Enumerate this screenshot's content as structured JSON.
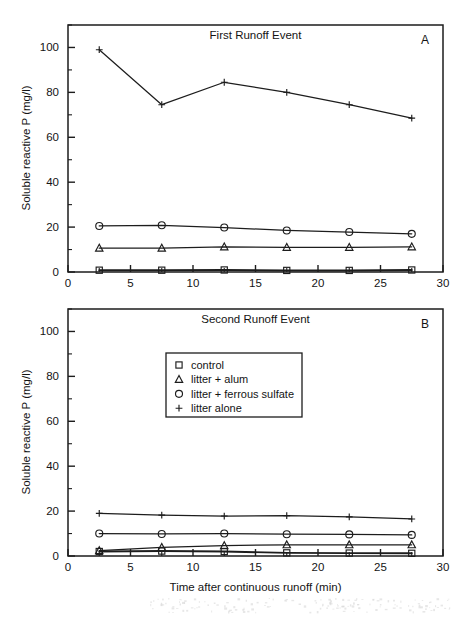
{
  "figure": {
    "axis_titles": {
      "y": "Soluble reactive P (mg/l)",
      "x": "Time after continuous runoff (min)"
    },
    "legend": {
      "entries": [
        {
          "marker": "square",
          "label": "control"
        },
        {
          "marker": "triangle",
          "label": "litter + alum"
        },
        {
          "marker": "circle",
          "label": "litter + ferrous sulfate"
        },
        {
          "marker": "plus",
          "label": "litter alone"
        }
      ]
    }
  },
  "chart_data": [
    {
      "type": "line",
      "panel": "A",
      "panel_letter": "A",
      "title": "First Runoff Event",
      "xlabel": "Time after continuous runoff (min)",
      "ylabel": "Soluble reactive P (mg/l)",
      "xlim": [
        0,
        30
      ],
      "ylim": [
        0,
        110
      ],
      "xticks": [
        0,
        5,
        10,
        15,
        20,
        25,
        30
      ],
      "xticklabels": [
        "0",
        "5",
        "10",
        "15",
        "20",
        "25",
        "30"
      ],
      "yticks": [
        0,
        20,
        40,
        60,
        80,
        100
      ],
      "yticklabels": [
        "0",
        "20",
        "40",
        "60",
        "80",
        "100"
      ],
      "yminorticks": [
        10,
        30,
        50,
        70,
        90,
        110
      ],
      "xminorticks": [
        2.5,
        7.5,
        12.5,
        17.5,
        22.5,
        27.5
      ],
      "grid": false,
      "legend": "none",
      "x": [
        2.5,
        7.5,
        12.5,
        17.5,
        22.5,
        27.5
      ],
      "series": [
        {
          "name": "litter alone",
          "marker": "plus",
          "values": [
            99.0,
            74.5,
            84.5,
            80.0,
            74.5,
            68.5
          ]
        },
        {
          "name": "litter + ferrous sulfate",
          "marker": "circle",
          "values": [
            20.5,
            20.8,
            19.8,
            18.5,
            17.8,
            17.0
          ]
        },
        {
          "name": "litter + alum",
          "marker": "triangle",
          "values": [
            10.6,
            10.6,
            11.2,
            11.0,
            11.0,
            11.2
          ]
        },
        {
          "name": "control",
          "marker": "square",
          "values": [
            0.8,
            0.8,
            0.9,
            0.7,
            0.7,
            0.9
          ]
        }
      ]
    },
    {
      "type": "line",
      "panel": "B",
      "panel_letter": "B",
      "title": "Second Runoff Event",
      "xlabel": "Time after continuous runoff (min)",
      "ylabel": "Soluble reactive P (mg/l)",
      "xlim": [
        0,
        30
      ],
      "ylim": [
        0,
        110
      ],
      "xticks": [
        0,
        5,
        10,
        15,
        20,
        25,
        30
      ],
      "xticklabels": [
        "0",
        "5",
        "10",
        "15",
        "20",
        "25",
        "30"
      ],
      "yticks": [
        0,
        20,
        40,
        60,
        80,
        100
      ],
      "yticklabels": [
        "0",
        "20",
        "40",
        "60",
        "80",
        "100"
      ],
      "yminorticks": [
        10,
        30,
        50,
        70,
        90,
        110
      ],
      "xminorticks": [
        2.5,
        7.5,
        12.5,
        17.5,
        22.5,
        27.5
      ],
      "grid": false,
      "legend": "upper-center",
      "x": [
        2.5,
        7.5,
        12.5,
        17.5,
        22.5,
        27.5
      ],
      "series": [
        {
          "name": "litter alone",
          "marker": "plus",
          "values": [
            19.0,
            18.2,
            17.8,
            18.0,
            17.4,
            16.5
          ]
        },
        {
          "name": "litter + ferrous sulfate",
          "marker": "circle",
          "values": [
            10.0,
            9.8,
            10.0,
            9.7,
            9.6,
            9.4
          ]
        },
        {
          "name": "litter + alum",
          "marker": "triangle",
          "values": [
            2.4,
            3.8,
            4.6,
            5.0,
            5.0,
            5.0
          ]
        },
        {
          "name": "control",
          "marker": "square",
          "values": [
            2.0,
            2.2,
            2.0,
            1.4,
            1.3,
            1.2
          ]
        }
      ]
    }
  ]
}
